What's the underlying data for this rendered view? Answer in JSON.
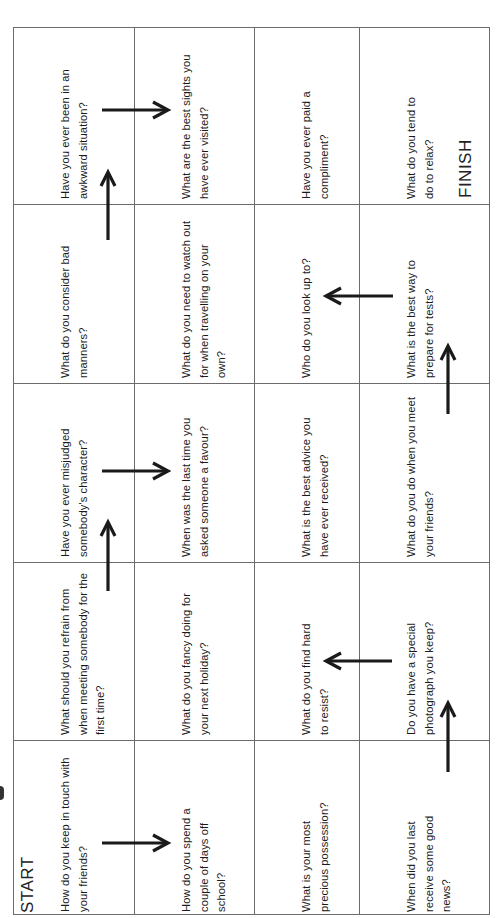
{
  "board": {
    "start_label": "START",
    "finish_label": "FINISH",
    "columns": 4,
    "rows": 5,
    "cells": [
      [
        {
          "text": "Have you ever been in an awkward situation?"
        },
        {
          "text": "What are the best sights you have ever visited?"
        },
        {
          "text": "Have you ever paid a compliment?"
        },
        {
          "text": "What do you tend to do to relax?"
        }
      ],
      [
        {
          "text": "What do you consider bad manners?"
        },
        {
          "text": "What do you need to watch out for when travelling on your own?"
        },
        {
          "text": "Who do you look up to?"
        },
        {
          "text": "What is the best way to prepare for tests?"
        }
      ],
      [
        {
          "text": "Have you ever misjudged somebody's character?"
        },
        {
          "text": "When was the last time you asked someone a favour?"
        },
        {
          "text": "What is the best advice you have ever received?"
        },
        {
          "text": "What do you do when you meet your friends?"
        }
      ],
      [
        {
          "text": "What should you refrain from when meeting somebody for the first time?"
        },
        {
          "text": "What do you fancy doing for your next holiday?"
        },
        {
          "text": "What do you find hard to resist?"
        },
        {
          "text": "Do you have a special photograph you keep?"
        }
      ],
      [
        {
          "text": "How do you keep in touch with your friends?"
        },
        {
          "text": "How do you spend a couple of days off school?"
        },
        {
          "text": "What is your most precious possession?"
        },
        {
          "text": "When did you last receive some good news?"
        }
      ]
    ],
    "path_arrows": [
      {
        "direction": "right",
        "from_cell": "r5c1",
        "to_cell": "r5c2"
      },
      {
        "direction": "up",
        "from_cell": "r5c4",
        "to_cell": "r4c4"
      },
      {
        "direction": "left",
        "from_cell": "r4c4",
        "to_cell": "r4c3"
      },
      {
        "direction": "up",
        "from_cell": "r4c1",
        "to_cell": "r3c1"
      },
      {
        "direction": "right",
        "from_cell": "r3c1",
        "to_cell": "r3c2"
      },
      {
        "direction": "up",
        "from_cell": "r3c4",
        "to_cell": "r2c4"
      },
      {
        "direction": "left",
        "from_cell": "r2c4",
        "to_cell": "r2c3"
      },
      {
        "direction": "up",
        "from_cell": "r2c1",
        "to_cell": "r1c1"
      },
      {
        "direction": "right",
        "from_cell": "r1c1",
        "to_cell": "r1c2"
      }
    ]
  },
  "colors": {
    "grid_line": "#6b6b6b",
    "text": "#1a1a1a",
    "arrow": "#1a1a1a",
    "background": "#ffffff"
  }
}
